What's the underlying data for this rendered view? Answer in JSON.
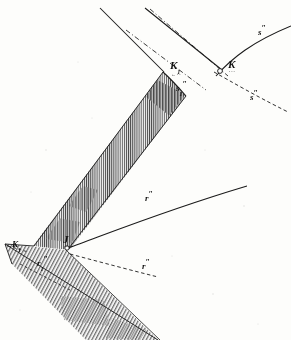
{
  "figure": {
    "kind": "engraved-line-diagram",
    "background_color": "#fdfdfb",
    "ink_color": "#1a1a1a",
    "hatch_color": "#3b3b3b",
    "labels": [
      {
        "id": "K1",
        "base": "K",
        "sub": "1",
        "prime": "",
        "underline": "←··",
        "x": 170,
        "y": 60,
        "size": "main"
      },
      {
        "id": "K",
        "base": "K",
        "sub": "",
        "prime": "",
        "underline": "···",
        "x": 228,
        "y": 59,
        "size": "main"
      },
      {
        "id": "s1pp",
        "base": "s",
        "sub": "1",
        "prime": "″",
        "underline": "",
        "x": 176,
        "y": 84,
        "size": "small"
      },
      {
        "id": "spp_up",
        "base": "s",
        "sub": "",
        "prime": "″",
        "underline": "",
        "x": 258,
        "y": 28,
        "size": "small"
      },
      {
        "id": "spp_dn",
        "base": "s",
        "sub": "",
        "prime": "″",
        "underline": "",
        "x": 250,
        "y": 93,
        "size": "small"
      },
      {
        "id": "rpp",
        "base": "r",
        "sub": "",
        "prime": "″",
        "underline": "",
        "x": 145,
        "y": 194,
        "size": "small"
      },
      {
        "id": "rpp_dn",
        "base": "r",
        "sub": "",
        "prime": "″",
        "underline": "",
        "x": 142,
        "y": 262,
        "size": "small"
      },
      {
        "id": "K1_l",
        "base": "K",
        "sub": "1",
        "prime": "",
        "underline": "",
        "x": 12,
        "y": 240,
        "size": "small"
      },
      {
        "id": "r1pp",
        "base": "r",
        "sub": "1",
        "prime": "″",
        "underline": "",
        "x": 37,
        "y": 259,
        "size": "small"
      },
      {
        "id": "J",
        "base": "J",
        "sub": "",
        "prime": "",
        "underline": "····",
        "x": 63,
        "y": 234,
        "size": "main"
      }
    ],
    "vertices": {
      "outer_left_apex": {
        "x": 4,
        "y": 243
      },
      "inner_apex": {
        "x": 66,
        "y": 248
      },
      "upper_cusp": {
        "x": 163,
        "y": 72
      },
      "crossing_point_K": {
        "x": 220,
        "y": 71
      }
    },
    "curves": [
      {
        "id": "s-curve-upper",
        "style": "solid",
        "description": "upper right branch through K labelled s″"
      },
      {
        "id": "s-curve-lower",
        "style": "dashed",
        "description": "lower right branch through K labelled s″"
      },
      {
        "id": "r-curve-upper",
        "style": "solid",
        "description": "curve from inner apex J to upper right labelled r″"
      },
      {
        "id": "r-curve-lower",
        "style": "dashed",
        "description": "curve from inner apex J to lower right labelled r″"
      },
      {
        "id": "ray-left-solid",
        "style": "solid",
        "description": "long straight ray to top-left"
      },
      {
        "id": "ray-right-solid",
        "style": "solid",
        "description": "long straight ray to top-right edge of band"
      },
      {
        "id": "ray-dashed",
        "style": "dashed",
        "description": "dash-dot ray paralleling band edge"
      }
    ],
    "bands": [
      {
        "id": "upper-band",
        "fill": "vertical-hatch",
        "description": "wide chevron arm from upper cusp down-left to apex"
      },
      {
        "id": "lower-band",
        "fill": "diagonal-hatch",
        "description": "lower chevron arm from apex down-right off the page"
      }
    ]
  }
}
